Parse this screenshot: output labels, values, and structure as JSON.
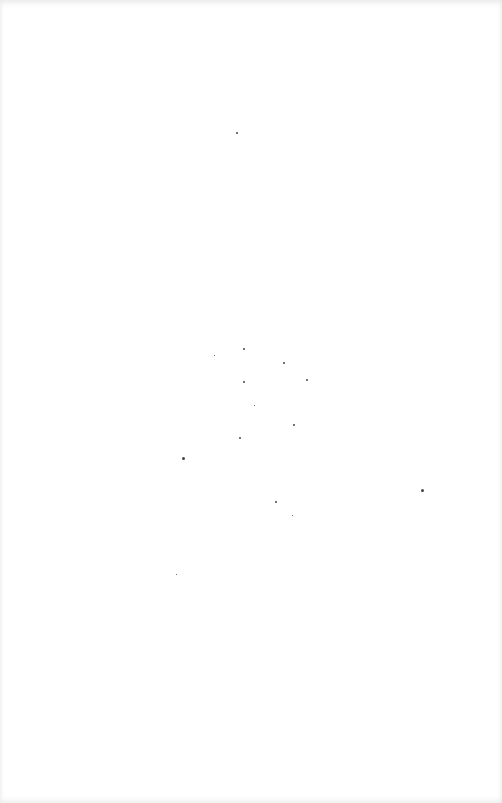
{
  "page": {
    "type": "blank-scanned-page",
    "background": "#ffffff",
    "speck_color": "#444444",
    "specks": [
      {
        "x": 236,
        "y": 132,
        "s": 2
      },
      {
        "x": 243,
        "y": 348,
        "s": 2
      },
      {
        "x": 243,
        "y": 381,
        "s": 2
      },
      {
        "x": 283,
        "y": 362,
        "s": 2
      },
      {
        "x": 306,
        "y": 379,
        "s": 2
      },
      {
        "x": 239,
        "y": 437,
        "s": 2
      },
      {
        "x": 293,
        "y": 424,
        "s": 2
      },
      {
        "x": 182,
        "y": 457,
        "s": 3
      },
      {
        "x": 275,
        "y": 501,
        "s": 2
      },
      {
        "x": 421,
        "y": 489,
        "s": 3
      },
      {
        "x": 214,
        "y": 355,
        "s": 1
      },
      {
        "x": 254,
        "y": 405,
        "s": 1
      },
      {
        "x": 292,
        "y": 515,
        "s": 1
      },
      {
        "x": 176,
        "y": 574,
        "s": 1
      }
    ]
  }
}
